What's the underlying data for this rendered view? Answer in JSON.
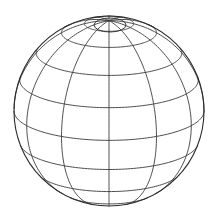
{
  "figure": {
    "background_color": "#ffffff",
    "line_color": "#3a3a3a",
    "outline_color": "#2b2b2b"
  },
  "geometry": {
    "center_x": 109,
    "center_y": 111,
    "radius": 95,
    "tilt_degrees": 18,
    "meridian_count": 12,
    "parallel_count": 7,
    "polar_cap_visible": true,
    "polar_cap_center_x": 110,
    "polar_cap_center_y": 25,
    "polar_cap_rx": 16,
    "polar_cap_ry": 7
  },
  "meridians": [
    {
      "id": "meridian-000",
      "longitude": 0
    },
    {
      "id": "meridian-030",
      "longitude": 30
    },
    {
      "id": "meridian-060",
      "longitude": 60
    },
    {
      "id": "meridian-090",
      "longitude": 90
    },
    {
      "id": "meridian-120",
      "longitude": 120
    },
    {
      "id": "meridian-150",
      "longitude": 150
    },
    {
      "id": "meridian-180",
      "longitude": 180
    },
    {
      "id": "meridian-210",
      "longitude": 210
    },
    {
      "id": "meridian-240",
      "longitude": 240
    },
    {
      "id": "meridian-270",
      "longitude": 270
    },
    {
      "id": "meridian-300",
      "longitude": 300
    },
    {
      "id": "meridian-330",
      "longitude": 330
    }
  ],
  "parallels": [
    {
      "id": "parallel-n75",
      "latitude": 75
    },
    {
      "id": "parallel-n60",
      "latitude": 60
    },
    {
      "id": "parallel-n40",
      "latitude": 40
    },
    {
      "id": "parallel-n20",
      "latitude": 20
    },
    {
      "id": "parallel-eq",
      "latitude": 0
    },
    {
      "id": "parallel-s20",
      "latitude": -20
    },
    {
      "id": "parallel-s40",
      "latitude": -40
    },
    {
      "id": "parallel-s60",
      "latitude": -60
    }
  ],
  "chart_data": {
    "type": "scatter",
    "xlabel": "",
    "ylabel": "",
    "grid": true,
    "legend_position": "none",
    "projection": "orthographic",
    "view_latitude_degrees": 18,
    "view_longitude_degrees": 0,
    "meridian_longitudes": [
      0,
      30,
      60,
      90,
      120,
      150,
      180,
      210,
      240,
      270,
      300,
      330
    ],
    "parallel_latitudes": [
      75,
      60,
      40,
      20,
      0,
      -20,
      -40,
      -60
    ],
    "sphere_center": [
      109,
      111
    ],
    "sphere_radius": 95
  }
}
